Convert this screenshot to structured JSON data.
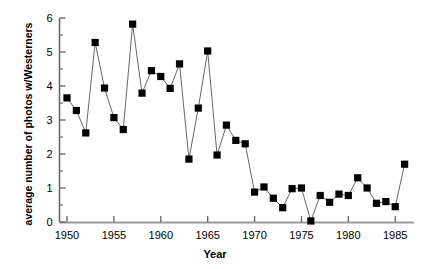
{
  "chart_data": {
    "type": "line",
    "title": "",
    "xlabel": "Year",
    "ylabel": "average number of photos w/Westerners",
    "xlim": [
      1949.2,
      1987.0
    ],
    "ylim": [
      0,
      6
    ],
    "xticks": [
      1950,
      1955,
      1960,
      1965,
      1970,
      1975,
      1980,
      1985
    ],
    "xticklabels": [
      "1950",
      "1955",
      "1960",
      "1965",
      "1970",
      "1975",
      "1980",
      "1985"
    ],
    "yticks": [
      0,
      1,
      2,
      3,
      4,
      5,
      6
    ],
    "yticklabels": [
      "0",
      "1",
      "2",
      "3",
      "4",
      "5",
      "6"
    ],
    "minor_yticks": [
      0.5,
      1.5,
      2.5,
      3.5,
      4.5,
      5.5
    ],
    "grid": false,
    "legend": null,
    "marker": "square",
    "marker_color": "#000000",
    "line_color": "#555555",
    "x": [
      1950,
      1951,
      1952,
      1953,
      1954,
      1955,
      1956,
      1957,
      1958,
      1959,
      1960,
      1961,
      1962,
      1963,
      1964,
      1965,
      1966,
      1967,
      1968,
      1969,
      1970,
      1971,
      1972,
      1973,
      1974,
      1975,
      1976,
      1977,
      1978,
      1979,
      1980,
      1981,
      1982,
      1983,
      1984,
      1985,
      1986
    ],
    "values": [
      3.65,
      3.28,
      2.62,
      5.28,
      3.94,
      3.07,
      2.72,
      5.82,
      3.79,
      4.45,
      4.28,
      3.93,
      4.65,
      1.85,
      3.35,
      5.03,
      1.97,
      2.85,
      2.4,
      2.3,
      0.88,
      1.03,
      0.7,
      0.42,
      0.98,
      1.0,
      0.03,
      0.78,
      0.58,
      0.82,
      0.78,
      1.3,
      1.0,
      0.55,
      0.6,
      0.45,
      1.7
    ]
  },
  "axes": {
    "x_title": "Year",
    "y_title": "average number of photos w/Westerners"
  }
}
